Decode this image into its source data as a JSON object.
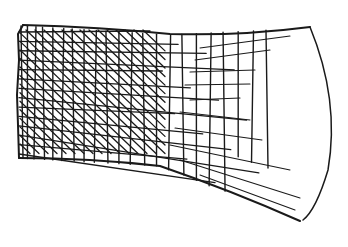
{
  "illustration": {
    "subject": "hand-drawn cross-hatched net sketch",
    "ink_color": "#1a1a1a",
    "background_color": "#ffffff",
    "grid": {
      "vertical_lines": 22,
      "horizontal_lines": 14,
      "diagonal_lines": 28
    }
  }
}
